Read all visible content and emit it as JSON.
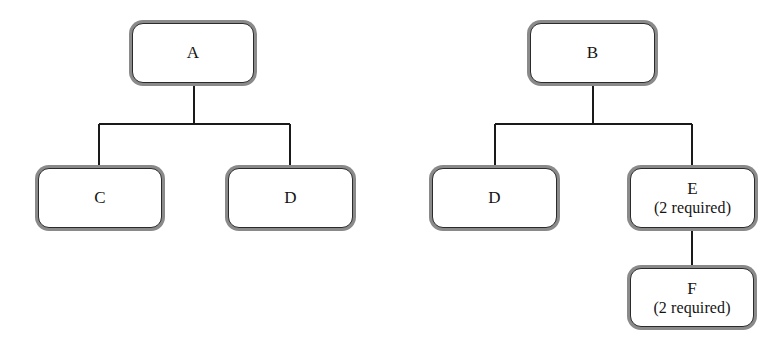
{
  "diagram": {
    "type": "tree",
    "background_color": "#ffffff",
    "node_fill_color": "#ffffff",
    "node_inner_border_color": "#2b2b2b",
    "node_outer_border_color": "#8a8a8a",
    "connector_color": "#1a1a1a",
    "text_color": "#141414",
    "trees": [
      {
        "name": "tree-a",
        "root": "A",
        "nodes": [
          {
            "id": "node-a",
            "label": "A",
            "sublabel": "",
            "x": 132,
            "y": 23,
            "w": 122,
            "h": 60
          },
          {
            "id": "node-c",
            "label": "C",
            "sublabel": "",
            "x": 38,
            "y": 168,
            "w": 124,
            "h": 60
          },
          {
            "id": "node-d-left",
            "label": "D",
            "sublabel": "",
            "x": 228,
            "y": 168,
            "w": 125,
            "h": 60
          }
        ],
        "edges": [
          {
            "from": "A",
            "to": "C"
          },
          {
            "from": "A",
            "to": "D"
          }
        ]
      },
      {
        "name": "tree-b",
        "root": "B",
        "nodes": [
          {
            "id": "node-b",
            "label": "B",
            "sublabel": "",
            "x": 530,
            "y": 23,
            "w": 125,
            "h": 60
          },
          {
            "id": "node-d-right",
            "label": "D",
            "sublabel": "",
            "x": 432,
            "y": 168,
            "w": 125,
            "h": 60
          },
          {
            "id": "node-e",
            "label": "E",
            "sublabel": "(2 required)",
            "x": 630,
            "y": 168,
            "w": 125,
            "h": 60
          },
          {
            "id": "node-f",
            "label": "F",
            "sublabel": "(2 required)",
            "x": 630,
            "y": 268,
            "w": 124,
            "h": 59
          }
        ],
        "edges": [
          {
            "from": "B",
            "to": "D"
          },
          {
            "from": "B",
            "to": "E"
          },
          {
            "from": "E",
            "to": "F"
          }
        ]
      }
    ]
  },
  "nodes": {
    "a": {
      "label": "A",
      "sublabel": ""
    },
    "c": {
      "label": "C",
      "sublabel": ""
    },
    "d_left": {
      "label": "D",
      "sublabel": ""
    },
    "b": {
      "label": "B",
      "sublabel": ""
    },
    "d_right": {
      "label": "D",
      "sublabel": ""
    },
    "e": {
      "label": "E",
      "sublabel": "(2 required)"
    },
    "f": {
      "label": "F",
      "sublabel": "(2 required)"
    }
  }
}
